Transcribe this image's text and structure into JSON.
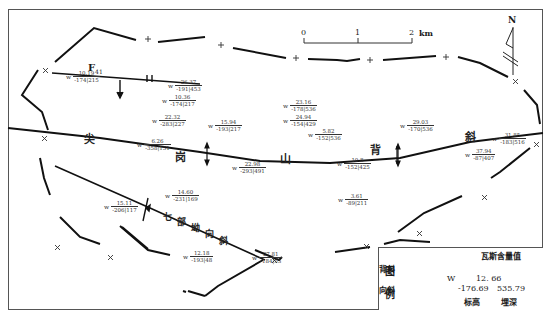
{
  "map": {
    "title_labels": {
      "anticline_name": [
        "尖",
        "岗",
        "山",
        "背",
        "斜"
      ],
      "syncline_name": [
        "七",
        "部",
        "坳",
        "向",
        "斜"
      ],
      "fault": {
        "letter": "F",
        "sub": "41"
      }
    },
    "scale_bar": {
      "ticks": [
        "0",
        "1",
        "2"
      ],
      "unit": "km"
    },
    "north_arrow": {
      "label": "N"
    }
  },
  "points": [
    {
      "id": "p1",
      "content": "10.19",
      "elev_depth": "-174|215",
      "x": 40,
      "y": 73
    },
    {
      "id": "p2",
      "content": "26.37",
      "elev_depth": "-191|453",
      "x": 160,
      "y": 82
    },
    {
      "id": "p3",
      "content": "10.36",
      "elev_depth": "-174|217",
      "x": 162,
      "y": 97
    },
    {
      "id": "p4",
      "content": "22.32",
      "elev_depth": "-283|227",
      "x": 152,
      "y": 117
    },
    {
      "id": "p5",
      "content": "15.94",
      "elev_depth": "-193|217",
      "x": 208,
      "y": 122
    },
    {
      "id": "p6",
      "content": "23.16",
      "elev_depth": "-178|536",
      "x": 283,
      "y": 102
    },
    {
      "id": "p7",
      "content": "24.94",
      "elev_depth": "-154|429",
      "x": 283,
      "y": 117
    },
    {
      "id": "p8",
      "content": "5.82",
      "elev_depth": "-152|536",
      "x": 308,
      "y": 131
    },
    {
      "id": "p9",
      "content": "29.03",
      "elev_depth": "-170|536",
      "x": 400,
      "y": 122
    },
    {
      "id": "p10",
      "content": "6.26",
      "elev_depth": "-358|151",
      "x": 137,
      "y": 141
    },
    {
      "id": "p11",
      "content": "22.98",
      "elev_depth": "-293|491",
      "x": 232,
      "y": 164
    },
    {
      "id": "p12",
      "content": "10.8",
      "elev_depth": "-152|425",
      "x": 337,
      "y": 160
    },
    {
      "id": "p13",
      "content": "31.85",
      "elev_depth": "-183|516",
      "x": 492,
      "y": 135
    },
    {
      "id": "p14",
      "content": "37.94",
      "elev_depth": "-87|407",
      "x": 465,
      "y": 150
    },
    {
      "id": "p15",
      "content": "14.60",
      "elev_depth": "-231|169",
      "x": 165,
      "y": 192
    },
    {
      "id": "p16",
      "content": "15.11",
      "elev_depth": "-206|117",
      "x": 104,
      "y": 203
    },
    {
      "id": "p17",
      "content": "3.61",
      "elev_depth": "-89|211",
      "x": 338,
      "y": 196
    },
    {
      "id": "p18",
      "content": "12.18",
      "elev_depth": "-193|48",
      "x": 183,
      "y": 253
    },
    {
      "id": "p19",
      "content": "27.81",
      "elev_depth": "-184|53",
      "x": 252,
      "y": 254
    }
  ],
  "legend": {
    "title_col": [
      "图",
      "例"
    ],
    "anticline_label": "背斜",
    "syncline_label": "向斜",
    "sample": {
      "prefix": "W",
      "header": "瓦斯含量值",
      "content": "12. 66",
      "elevation": "-176.69",
      "depth": "535.79",
      "elev_label": "标高",
      "depth_label": "埋深"
    }
  }
}
